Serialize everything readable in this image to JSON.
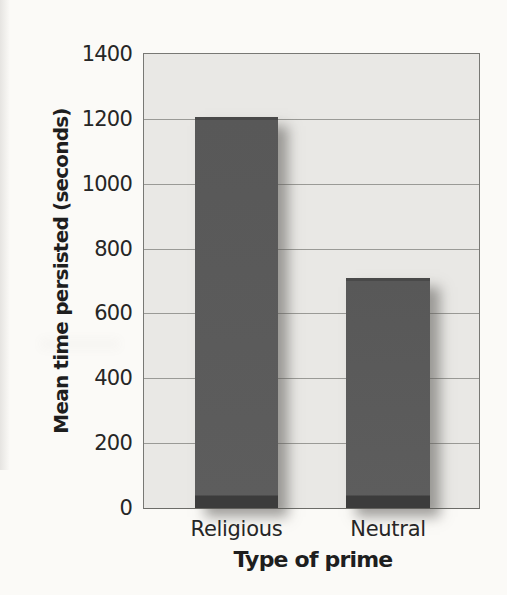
{
  "chart_data": {
    "type": "bar",
    "title": "",
    "xlabel": "Type of prime",
    "ylabel": "Mean time persisted (seconds)",
    "categories": [
      "Religious",
      "Neutral"
    ],
    "values": [
      1205,
      710
    ],
    "ylim": [
      0,
      1400
    ],
    "yticks": [
      0,
      200,
      400,
      600,
      800,
      1000,
      1200,
      1400
    ],
    "grid": true,
    "legend": "none",
    "colors": {
      "bar": "#585858",
      "bar_base_band": "#3c3c3c",
      "bar_top_edge": "#494949",
      "plot_background": "#e9e8e5",
      "gridline": "#9a9a96",
      "plot_border": "#787874",
      "text": "#262626",
      "page_background": "#fbfaf7"
    }
  }
}
